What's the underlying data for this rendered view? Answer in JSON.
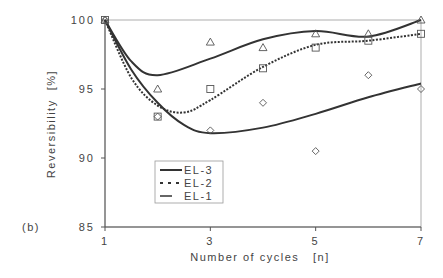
{
  "panel_label": "(b)",
  "chart_data": {
    "type": "scatter",
    "title": "",
    "xlabel": "Number of cycles   [n]",
    "ylabel": "Reversibility  [%]",
    "xlim": [
      1,
      7
    ],
    "ylim": [
      85,
      100
    ],
    "xticks": [
      1,
      3,
      5,
      7
    ],
    "yticks": [
      85,
      90,
      95,
      100
    ],
    "grid": false,
    "legend_position": "lower-left-inside",
    "series": [
      {
        "name": "EL-3",
        "marker": "triangle",
        "line": "solid",
        "x": [
          1,
          2,
          3,
          4,
          5,
          6,
          7
        ],
        "values": [
          100,
          95,
          98.4,
          98,
          99,
          99,
          100
        ],
        "fit": [
          [
            1,
            100
          ],
          [
            1.5,
            97
          ],
          [
            2,
            96
          ],
          [
            3,
            97.2
          ],
          [
            4,
            98.6
          ],
          [
            5,
            99.2
          ],
          [
            6,
            98.8
          ],
          [
            7,
            100
          ]
        ]
      },
      {
        "name": "EL-2",
        "marker": "square",
        "line": "dashed",
        "x": [
          1,
          2,
          3,
          4,
          5,
          6,
          7
        ],
        "values": [
          100,
          93,
          95,
          96.5,
          98,
          98.5,
          99
        ],
        "fit": [
          [
            1,
            100
          ],
          [
            1.5,
            95.8
          ],
          [
            2,
            93.8
          ],
          [
            2.5,
            93.3
          ],
          [
            3,
            94.2
          ],
          [
            4,
            96.6
          ],
          [
            5,
            98.2
          ],
          [
            6,
            98.5
          ],
          [
            7,
            99
          ]
        ]
      },
      {
        "name": "EL-1",
        "marker": "diamond",
        "line": "solid",
        "x": [
          1,
          2,
          3,
          4,
          5,
          6,
          7
        ],
        "values": [
          100,
          93,
          92,
          94,
          90.5,
          96,
          95
        ],
        "fit": [
          [
            1,
            100
          ],
          [
            1.5,
            96.4
          ],
          [
            2,
            94
          ],
          [
            2.5,
            92.4
          ],
          [
            3,
            91.8
          ],
          [
            4,
            92.2
          ],
          [
            5,
            93.2
          ],
          [
            6,
            94.4
          ],
          [
            7,
            95.4
          ]
        ]
      }
    ]
  }
}
